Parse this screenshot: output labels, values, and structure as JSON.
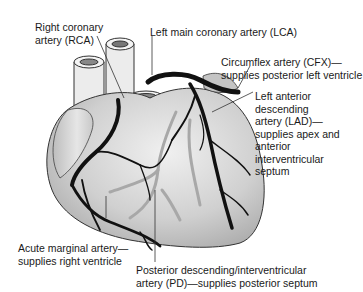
{
  "diagram": {
    "labels": {
      "rca": {
        "line1": "Right coronary",
        "line2": "artery (RCA)"
      },
      "lca": {
        "line1": "Left main coronary artery (LCA)"
      },
      "cfx": {
        "line1": "Circumflex artery (CFX)—",
        "line2": "supplies posterior left ventricle"
      },
      "lad": {
        "line1": "Left anterior",
        "line2": "descending",
        "line3": "artery (LAD)—",
        "line4": "supplies apex and",
        "line5": "anterior",
        "line6": "interventricular",
        "line7": "septum"
      },
      "acute_marginal": {
        "line1": "Acute marginal artery—",
        "line2": "supplies right ventricle"
      },
      "pd": {
        "line1": "Posterior descending/interventricular",
        "line2": "artery (PD)—supplies posterior septum"
      }
    },
    "colors": {
      "artery": "#111111",
      "posterior_artery": "#a8a8a8",
      "heart_fill": "#d4d4d4",
      "vessel_fill": "#ececec",
      "leader_line": "#333333"
    }
  }
}
